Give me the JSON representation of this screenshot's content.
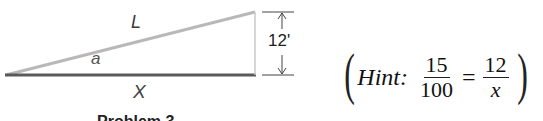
{
  "diagram": {
    "hypotenuse_label": "L",
    "angle_label": "a",
    "base_label": "X",
    "height_label": "12'",
    "caption": "Problem 3",
    "colors": {
      "hypotenuse": "#b8b8b8",
      "base": "#555555",
      "vertical": "#c8c8c8",
      "dimension": "#333333"
    }
  },
  "hint": {
    "word": "Hint:",
    "fraction1": {
      "numerator": "15",
      "denominator": "100"
    },
    "equals": "=",
    "fraction2": {
      "numerator": "12",
      "denominator": "x"
    },
    "open_paren": "(",
    "close_paren": ")"
  }
}
